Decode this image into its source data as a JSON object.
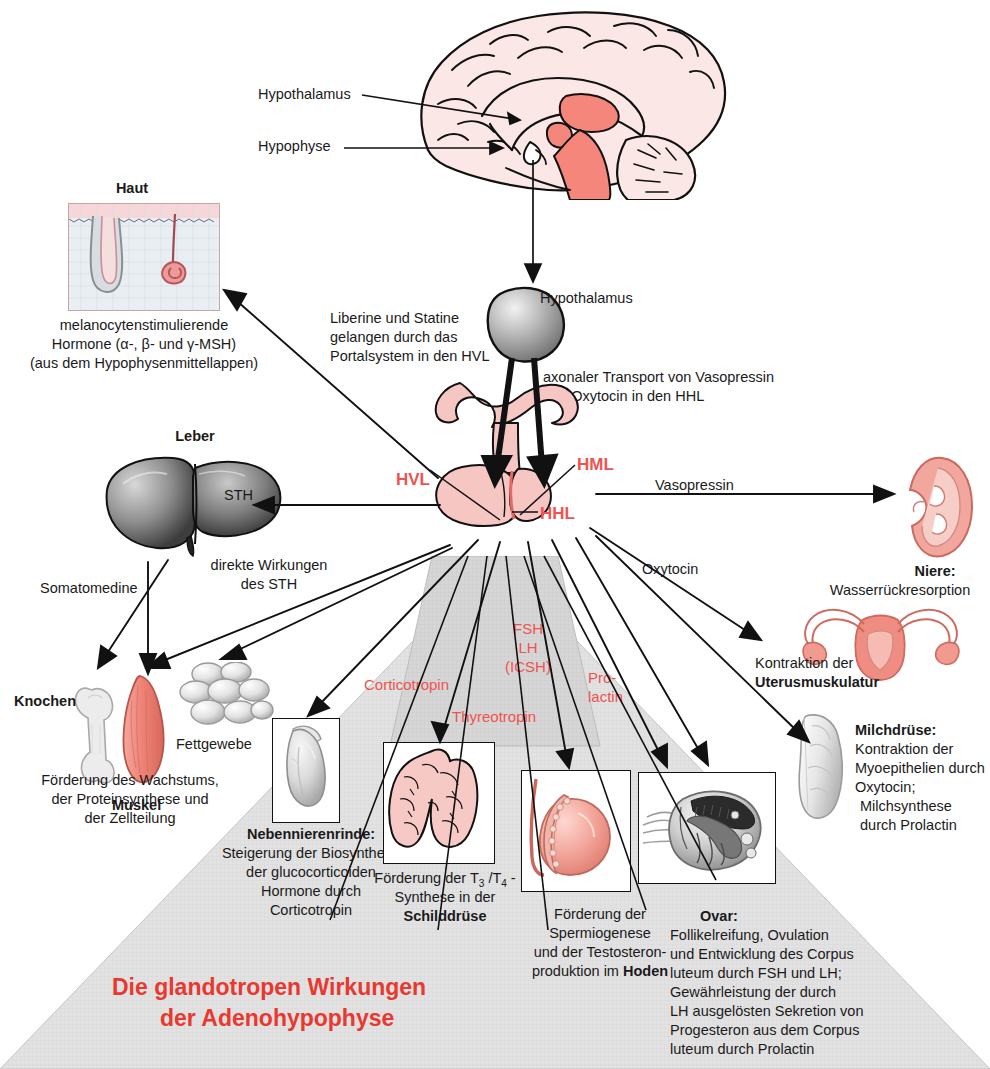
{
  "title": {
    "line1": "Die glandotropen Wirkungen",
    "line2": "der Adenohypophyse"
  },
  "brain": {
    "hypothalamus_label": "Hypothalamus",
    "hypophyse_label": "Hypophyse"
  },
  "skin": {
    "heading": "Haut",
    "caption_line1": "melanocytenstimulierende",
    "caption_line2": "Hormone (α-, β- und γ-MSH)",
    "caption_line3": "(aus dem Hypophysenmittellappen)"
  },
  "center": {
    "hypothalamus_label": "Hypothalamus",
    "portal_line1": "Liberine und Statine",
    "portal_line2": "gelangen durch das",
    "portal_line3": "Portalsystem in den HVL",
    "axonal_line1": "axonaler Transport von Vasopressin",
    "axonal_line2": "und Oxytocin in den HHL",
    "hvl": "HVL",
    "hml": "HML",
    "hhl": "HHL"
  },
  "liver": {
    "heading": "Leber",
    "sth_label": "STH",
    "somatomedine_label": "Somatomedine",
    "direct_line1": "direkte Wirkungen",
    "direct_line2": "des STH"
  },
  "bone_muscle_fat": {
    "knochen": "Knochen",
    "muskel": "Muskel",
    "fettgewebe": "Fettgewebe",
    "caption_line1": "Förderung des Wachstums,",
    "caption_line2": "der Proteinsynthese und",
    "caption_line3": "der Zellteilung"
  },
  "kidney": {
    "vasopressin_label": "Vasopressin",
    "heading": "Niere:",
    "caption": "Wasserrückresorption"
  },
  "uterus": {
    "oxytocin_label": "Oxytocin",
    "caption_line1": "Kontraktion der",
    "caption_line2": "Uterusmuskulatur"
  },
  "mammary": {
    "heading": "Milchdrüse:",
    "caption_line1": "Kontraktion der",
    "caption_line2": "Myoepithelien durch",
    "caption_line3": "Oxytocin;",
    "caption_line4": "Milchsynthese",
    "caption_line5": "durch Prolactin"
  },
  "hormones": {
    "corticotropin": "Corticotropin",
    "thyreotropin": "Thyreotropin",
    "fsh": "FSH",
    "lh": "LH",
    "icsh": "(ICSH)",
    "prolactin_line1": "Pro-",
    "prolactin_line2": "lactin"
  },
  "adrenal": {
    "heading": "Nebennierenrinde:",
    "caption_line1": "Steigerung der Biosynthese",
    "caption_line2": "der glucocorticoiden",
    "caption_line3": "Hormone durch",
    "caption_line4": "Corticotropin"
  },
  "thyroid": {
    "caption_pre": "Förderung der T",
    "sub1": "3",
    "caption_mid": " /T",
    "sub2": "4",
    "caption_post": " -",
    "caption_line2": "Synthese in der",
    "caption_line3": "Schilddrüse"
  },
  "testis": {
    "caption_line1": "Förderung der",
    "caption_line2": "Spermiogenese",
    "caption_line3": "und der Testosteron-",
    "caption_line4_pre": "produktion im ",
    "caption_line4_bold": "Hoden"
  },
  "ovary": {
    "heading": "Ovar:",
    "caption_line1": "Follikelreifung, Ovulation",
    "caption_line2": "und Entwicklung des Corpus",
    "caption_line3": "luteum durch FSH und LH;",
    "caption_line4": "Gewährleistung der durch",
    "caption_line5": "LH ausgelösten Sekretion von",
    "caption_line6": "Progesteron aus dem Corpus",
    "caption_line7": "luteum durch Prolactin"
  },
  "colors": {
    "accent_red": "#e8382f",
    "hormone_red": "#ef5350",
    "tissue_pink": "#f6c6c3",
    "tissue_salmon": "#f08a80",
    "triangle_gray": "#dcdcdc",
    "line_black": "#111111"
  }
}
